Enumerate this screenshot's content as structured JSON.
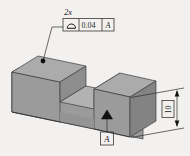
{
  "drawing": {
    "title": "Profile of a surface tolerance on isometric slotted block",
    "background_color": "#f2f1ef"
  },
  "annotations": {
    "quantity_note": "2x",
    "feature_control_frame": {
      "symbol_name": "profile-of-a-surface-symbol",
      "symbol_glyph": "⌓",
      "tolerance_value": "0.04",
      "datum_reference": "A"
    },
    "datum_feature": {
      "label": "A",
      "symbol_name": "datum-feature-triangle"
    },
    "dimension": {
      "value": "10",
      "is_basic": true,
      "orientation": "vertical"
    }
  },
  "solid": {
    "name": "slotted-block",
    "face_colors": {
      "top": "#a8a8a8",
      "front": "#9a9a9a",
      "side": "#8a8a8a",
      "slot_floor": "#b0b0b0",
      "slot_wall": "#909090",
      "edge": "#4a4a4a"
    }
  }
}
